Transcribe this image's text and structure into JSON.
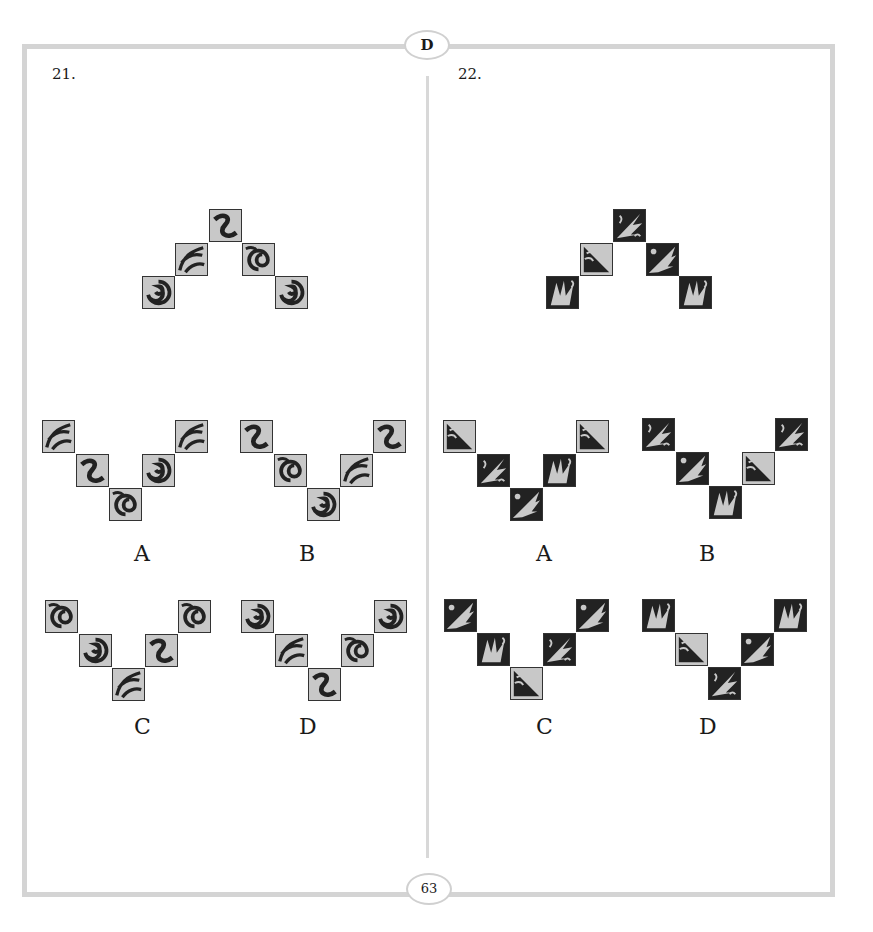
{
  "header": {
    "section_letter": "D"
  },
  "footer": {
    "page_number": "63"
  },
  "questions": [
    {
      "number": "21.",
      "style": "swirl",
      "stimulus_tiles": 5,
      "options": [
        {
          "label": "A"
        },
        {
          "label": "B"
        },
        {
          "label": "C"
        },
        {
          "label": "D"
        }
      ]
    },
    {
      "number": "22.",
      "style": "spike",
      "stimulus_tiles": 5,
      "options": [
        {
          "label": "A"
        },
        {
          "label": "B"
        },
        {
          "label": "C"
        },
        {
          "label": "D"
        }
      ]
    }
  ],
  "colors": {
    "frame": "#d4d4d4",
    "tile_light": "#c8c8c8",
    "tile_dark": "#222222"
  }
}
